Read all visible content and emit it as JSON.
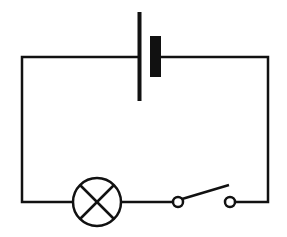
{
  "diagram": {
    "type": "circuit",
    "title": "",
    "components": [
      {
        "id": "battery",
        "kind": "cell",
        "label": ""
      },
      {
        "id": "lamp",
        "kind": "lamp",
        "label": ""
      },
      {
        "id": "switch",
        "kind": "switch",
        "state": "open",
        "label": ""
      }
    ],
    "connections": [
      [
        "battery",
        "lamp"
      ],
      [
        "lamp",
        "switch"
      ],
      [
        "switch",
        "battery"
      ]
    ],
    "colors": {
      "line": "#111111",
      "background": "#ffffff"
    }
  }
}
